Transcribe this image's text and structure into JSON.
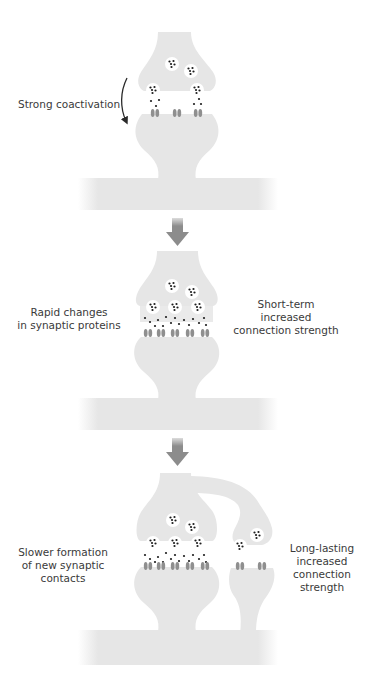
{
  "colors": {
    "tissue": "#e6e6e6",
    "receptor": "#8f8f8f",
    "vesicle_fill": "#ffffff",
    "transmitter": "#1e1e1e",
    "step_arrow": "#8c8c8c",
    "curved_arrow": "#2a2a2a",
    "text": "#3a3a3a"
  },
  "panels": [
    {
      "stage": 1,
      "left_label": [
        "Strong coactivation"
      ],
      "right_label": [],
      "presynaptic_vesicles_docked": 2,
      "receptor_pairs": 3,
      "has_curved_arrow": true
    },
    {
      "stage": 2,
      "left_label": [
        "Rapid changes",
        "in synaptic proteins"
      ],
      "right_label": [
        "Short-term",
        "increased",
        "connection strength"
      ],
      "presynaptic_vesicles_docked": 3,
      "receptor_pairs": 5,
      "has_curved_arrow": false
    },
    {
      "stage": 3,
      "left_label": [
        "Slower formation",
        "of new synaptic",
        "contacts"
      ],
      "right_label": [
        "Long-lasting",
        "increased",
        "connection",
        "strength"
      ],
      "presynaptic_vesicles_docked": 3,
      "receptor_pairs": 5,
      "new_contact_receptor_pairs": 2,
      "has_curved_arrow": false
    }
  ],
  "step_arrows": [
    {
      "from": 1,
      "to": 2
    },
    {
      "from": 2,
      "to": 3
    }
  ]
}
